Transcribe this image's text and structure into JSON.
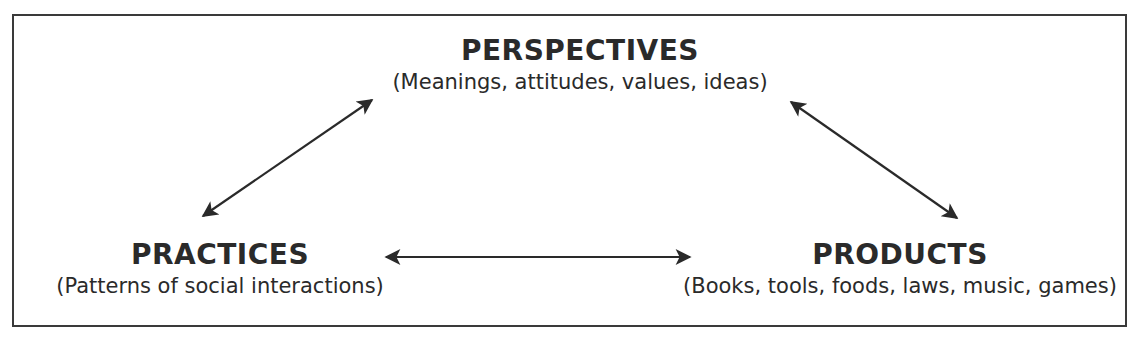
{
  "diagram": {
    "nodes": {
      "perspectives": {
        "title": "PERSPECTIVES",
        "subtitle": "(Meanings, attitudes, values, ideas)"
      },
      "practices": {
        "title": "PRACTICES",
        "subtitle": "(Patterns of social interactions)"
      },
      "products": {
        "title": "PRODUCTS",
        "subtitle": "(Books, tools, foods, laws, music, games)"
      }
    },
    "edges": [
      {
        "from": "practices",
        "to": "perspectives",
        "type": "bidirectional"
      },
      {
        "from": "perspectives",
        "to": "products",
        "type": "bidirectional"
      },
      {
        "from": "practices",
        "to": "products",
        "type": "bidirectional"
      }
    ],
    "colors": {
      "ink": "#2a2a2a",
      "border": "#3a3a3a",
      "background": "#ffffff"
    }
  }
}
